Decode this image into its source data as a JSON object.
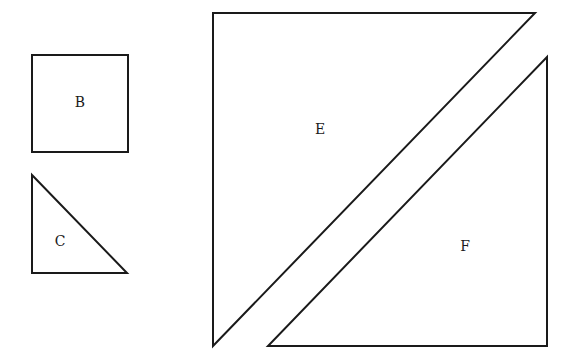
{
  "diagram": {
    "shapes": [
      {
        "id": "B",
        "type": "square",
        "label": "B",
        "points": [
          [
            32,
            55
          ],
          [
            128,
            55
          ],
          [
            128,
            152
          ],
          [
            32,
            152
          ]
        ],
        "label_pos": [
          80,
          102
        ]
      },
      {
        "id": "C",
        "type": "right-triangle",
        "label": "C",
        "points": [
          [
            32,
            175
          ],
          [
            127,
            273
          ],
          [
            32,
            273
          ]
        ],
        "label_pos": [
          60,
          241
        ]
      },
      {
        "id": "E",
        "type": "right-triangle",
        "label": "E",
        "points": [
          [
            213,
            13
          ],
          [
            535,
            13
          ],
          [
            213,
            346
          ]
        ],
        "label_pos": [
          320,
          129
        ]
      },
      {
        "id": "F",
        "type": "right-triangle",
        "label": "F",
        "points": [
          [
            547,
            57
          ],
          [
            547,
            346
          ],
          [
            268,
            346
          ]
        ],
        "label_pos": [
          465,
          246
        ]
      }
    ],
    "stroke_color": "#1a1a1a",
    "background": "#ffffff"
  }
}
